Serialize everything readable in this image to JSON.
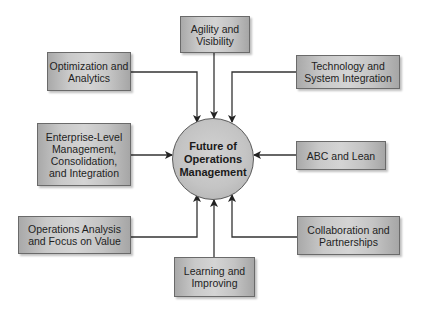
{
  "diagram": {
    "center": {
      "label": "Future of\nOperations\nManagement"
    },
    "nodes": [
      {
        "id": "agility",
        "label": "Agility and\nVisibility"
      },
      {
        "id": "optimization",
        "label": "Optimization and\nAnalytics"
      },
      {
        "id": "technology",
        "label": "Technology and\nSystem Integration"
      },
      {
        "id": "enterprise",
        "label": "Enterprise-Level\nManagement,\nConsolidation,\nand Integration"
      },
      {
        "id": "abc",
        "label": "ABC and Lean"
      },
      {
        "id": "operations-analysis",
        "label": "Operations Analysis\nand Focus on Value"
      },
      {
        "id": "collaboration",
        "label": "Collaboration and\nPartnerships"
      },
      {
        "id": "learning",
        "label": "Learning and\nImproving"
      }
    ],
    "edges": [
      {
        "from": "agility",
        "to": "center"
      },
      {
        "from": "optimization",
        "to": "center"
      },
      {
        "from": "technology",
        "to": "center"
      },
      {
        "from": "enterprise",
        "to": "center"
      },
      {
        "from": "abc",
        "to": "center"
      },
      {
        "from": "operations-analysis",
        "to": "center"
      },
      {
        "from": "collaboration",
        "to": "center"
      },
      {
        "from": "learning",
        "to": "center"
      }
    ]
  }
}
